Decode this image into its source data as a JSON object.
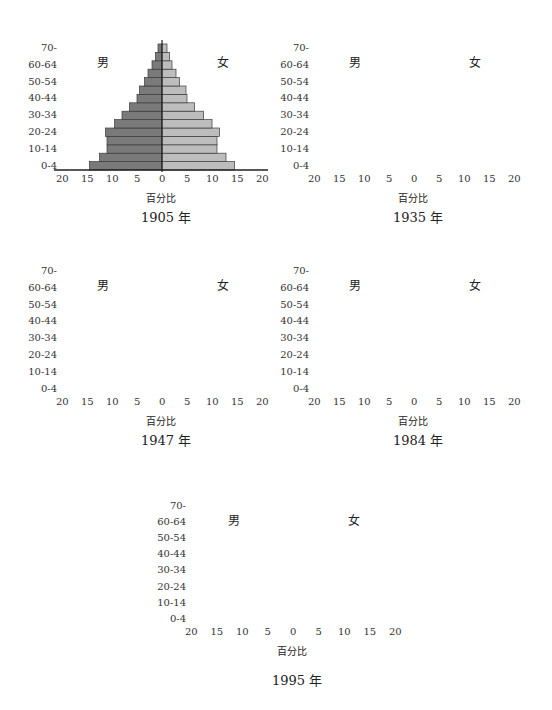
{
  "labels": {
    "male": "男",
    "female": "女",
    "axis_title": "百分比",
    "age_ticks": [
      "0-4",
      "10-14",
      "20-24",
      "30-34",
      "40-44",
      "50-54",
      "60-64",
      "70-"
    ],
    "x_ticks": [
      "20",
      "15",
      "10",
      "5",
      "0",
      "5",
      "10",
      "15",
      "20"
    ]
  },
  "colors": {
    "male_bar": "#7a7a7a",
    "female_bar": "#bdbdbd",
    "bar_border": "#3a3a3a",
    "axis": "#222222"
  },
  "charts": [
    {
      "title": "1905 年"
    },
    {
      "title": "1935 年"
    },
    {
      "title": "1947 年"
    },
    {
      "title": "1984 年"
    },
    {
      "title": "1995 年"
    }
  ],
  "chart_data": [
    {
      "type": "bar",
      "subtype": "population-pyramid",
      "title": "1905 年",
      "xlabel": "百分比",
      "ylabel": "",
      "xlim": [
        -20,
        20
      ],
      "categories": [
        "0-4",
        "5-9",
        "10-14",
        "15-19",
        "20-24",
        "25-29",
        "30-34",
        "35-39",
        "40-44",
        "45-49",
        "50-54",
        "55-59",
        "60-64",
        "65-69",
        "70-"
      ],
      "series": [
        {
          "name": "男",
          "values": [
            14.5,
            12.5,
            11,
            11,
            11.3,
            9.5,
            8,
            6.5,
            5,
            4.5,
            3.5,
            2.8,
            2,
            1.3,
            0.8
          ]
        },
        {
          "name": "女",
          "values": [
            14.5,
            12.8,
            11,
            11,
            11.5,
            10,
            8.3,
            6.5,
            5,
            4.8,
            3.5,
            2.8,
            2,
            1.5,
            1
          ]
        }
      ]
    },
    {
      "type": "bar",
      "subtype": "population-pyramid",
      "title": "1935 年",
      "xlabel": "百分比",
      "ylabel": "",
      "xlim": [
        -20,
        20
      ],
      "categories": [
        "0-4",
        "5-9",
        "10-14",
        "15-19",
        "20-24",
        "25-29",
        "30-34",
        "35-39",
        "40-44",
        "45-49",
        "50-54",
        "55-59",
        "60-64",
        "65-69",
        "70-"
      ],
      "series": [
        {
          "name": "男",
          "values": [
            16.5,
            12.8,
            10.3,
            8.8,
            8.8,
            7.3,
            6.2,
            5,
            4,
            3.5,
            3.2,
            2,
            1.2,
            0.8,
            0.6
          ]
        },
        {
          "name": "女",
          "values": [
            16.7,
            13,
            10.8,
            8.8,
            8.8,
            7.6,
            6.5,
            5,
            4,
            3.5,
            3.2,
            2.9,
            1.8,
            1,
            1
          ]
        }
      ]
    },
    {
      "type": "bar",
      "subtype": "population-pyramid",
      "title": "1947 年",
      "xlabel": "百分比",
      "ylabel": "",
      "xlim": [
        -20,
        20
      ],
      "categories": [
        "0-4",
        "5-9",
        "10-14",
        "15-19",
        "20-24",
        "25-29",
        "30-34",
        "35-39",
        "40-44",
        "45-49",
        "50-54",
        "55-59",
        "60-64",
        "65-69",
        "70-"
      ],
      "series": [
        {
          "name": "男",
          "values": [
            15.3,
            14.8,
            13.6,
            11.4,
            9.6,
            8.4,
            7,
            6.4,
            5.8,
            4.6,
            3.6,
            2,
            1.4,
            1.2,
            0.8
          ]
        },
        {
          "name": "女",
          "values": [
            15.3,
            14.6,
            13.4,
            11.6,
            9.8,
            8.4,
            7.8,
            6.8,
            6.4,
            4.8,
            3.6,
            2.4,
            1.8,
            1.4,
            1.2
          ]
        }
      ]
    },
    {
      "type": "bar",
      "subtype": "population-pyramid",
      "title": "1984 年",
      "xlabel": "百分比",
      "ylabel": "",
      "xlim": [
        -20,
        20
      ],
      "categories": [
        "0-4",
        "5-9",
        "10-14",
        "15-19",
        "20-24",
        "25-29",
        "30-34",
        "35-39",
        "40-44",
        "45-49",
        "50-54",
        "55-59",
        "60-64",
        "65-69",
        "70-"
      ],
      "series": [
        {
          "name": "男",
          "values": [
            10.5,
            10.5,
            9.6,
            10.4,
            10.4,
            9.6,
            8.4,
            5.2,
            5,
            4.5,
            4.8,
            4.8,
            3.4,
            2.4,
            3.2
          ]
        },
        {
          "name": "女",
          "values": [
            10.8,
            10.8,
            9.8,
            10.6,
            10.8,
            10,
            8.6,
            5.2,
            5.2,
            5,
            5.2,
            4.8,
            3.6,
            2.4,
            3.2
          ]
        }
      ]
    },
    {
      "type": "bar",
      "subtype": "population-pyramid",
      "title": "1995 年",
      "xlabel": "百分比",
      "ylabel": "",
      "xlim": [
        -20,
        20
      ],
      "categories": [
        "0-4",
        "5-9",
        "10-14",
        "15-19",
        "20-24",
        "25-29",
        "30-34",
        "35-39",
        "40-44",
        "45-49",
        "50-54",
        "55-59",
        "60-64",
        "65-69",
        "70-"
      ],
      "series": [
        {
          "name": "男",
          "values": [
            7.6,
            7.6,
            9,
            9.8,
            8.4,
            8.8,
            9.8,
            9.2,
            8.4,
            6,
            5,
            4.8,
            3.4,
            2.8,
            5.2
          ]
        },
        {
          "name": "女",
          "values": [
            7.6,
            7.6,
            9.2,
            10,
            8.8,
            9,
            10.4,
            9.6,
            8.6,
            6.2,
            5.2,
            5.2,
            3.6,
            3,
            5.2
          ]
        }
      ]
    }
  ]
}
